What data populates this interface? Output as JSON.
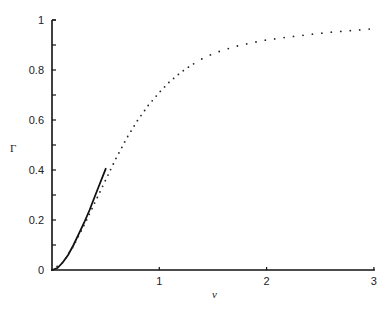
{
  "chart_data": {
    "type": "line",
    "title": "",
    "xlabel": "ν",
    "ylabel": "Γ",
    "xlim": [
      0,
      3
    ],
    "ylim": [
      0,
      1
    ],
    "grid": false,
    "legend": null,
    "x_ticks": [
      "1",
      "2",
      "3"
    ],
    "y_ticks": [
      "0",
      "0.2",
      "0.4",
      "0.6",
      "0.8",
      "1"
    ],
    "series": [
      {
        "name": "approximation (solid)",
        "style": "solid",
        "x": [
          0,
          0.05,
          0.1,
          0.15,
          0.2,
          0.25,
          0.3,
          0.35,
          0.4,
          0.45,
          0.5
        ],
        "y": [
          0,
          0.008,
          0.03,
          0.06,
          0.1,
          0.145,
          0.19,
          0.24,
          0.295,
          0.35,
          0.405
        ]
      },
      {
        "name": "exact (dotted)",
        "style": "dotted",
        "x": [
          0,
          0.1,
          0.2,
          0.3,
          0.4,
          0.5,
          0.6,
          0.7,
          0.8,
          0.9,
          1.0,
          1.1,
          1.2,
          1.3,
          1.4,
          1.5,
          1.6,
          1.7,
          1.8,
          1.9,
          2.0,
          2.2,
          2.4,
          2.6,
          2.8,
          3.0
        ],
        "y": [
          0,
          0.03,
          0.095,
          0.18,
          0.27,
          0.36,
          0.45,
          0.53,
          0.6,
          0.66,
          0.71,
          0.755,
          0.79,
          0.82,
          0.845,
          0.865,
          0.88,
          0.893,
          0.903,
          0.912,
          0.92,
          0.932,
          0.942,
          0.951,
          0.958,
          0.965
        ]
      }
    ]
  },
  "axes": {
    "ylabel": "Γ",
    "xlabel": "ν"
  }
}
